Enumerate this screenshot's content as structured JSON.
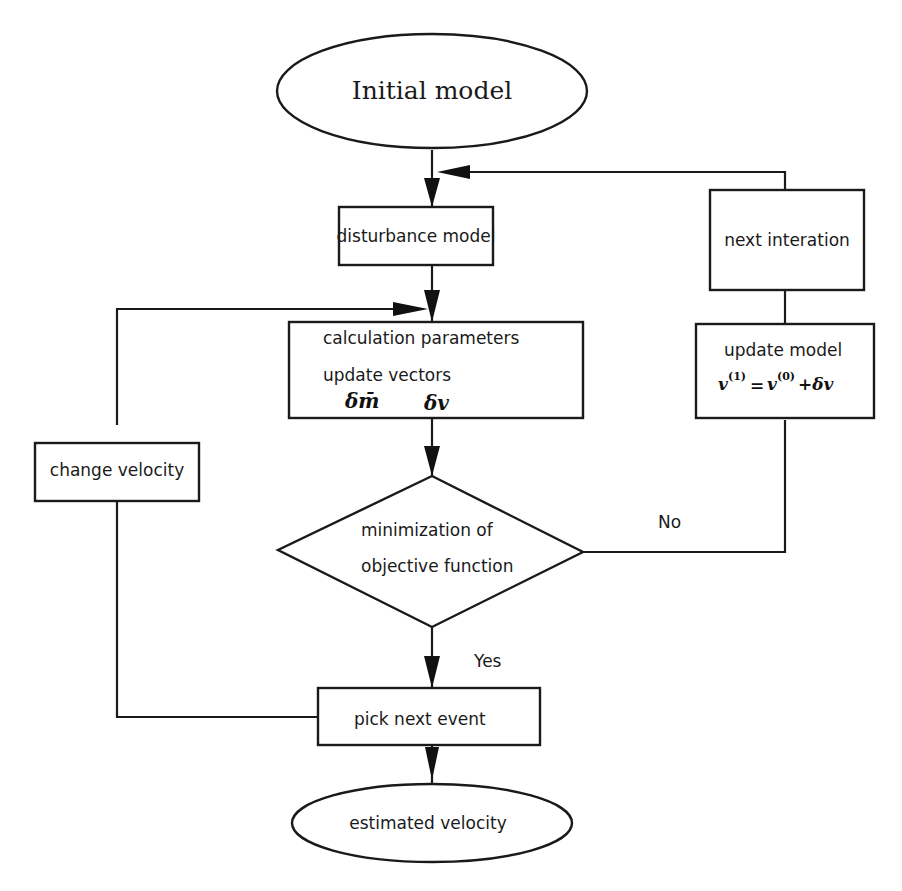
{
  "diagram": {
    "nodes": {
      "initial_model": {
        "label": "Initial model",
        "shape": "ellipse"
      },
      "disturbance_model": {
        "label": "disturbance model",
        "shape": "rect"
      },
      "calculation": {
        "line1": "calculation parameters",
        "line2": "update vectors",
        "symbol1": "δm̄",
        "symbol2": "δv",
        "shape": "rect"
      },
      "decision": {
        "line1": "minimization of",
        "line2": "objective function",
        "shape": "diamond"
      },
      "pick_next_event": {
        "label": "pick next event",
        "shape": "rect"
      },
      "estimated_velocity": {
        "label": "estimated velocity",
        "shape": "ellipse"
      },
      "change_velocity": {
        "label": "change velocity",
        "shape": "rect"
      },
      "next_iteration": {
        "label": "next interation",
        "shape": "rect"
      },
      "update_model": {
        "line1": "update model",
        "formula_lhs": "v",
        "formula_lhs_sup": "(1)",
        "formula_eq": "=",
        "formula_rhs": "v",
        "formula_rhs_sup": "(0)",
        "formula_plus": "+δv",
        "shape": "rect"
      }
    },
    "edge_labels": {
      "no": "No",
      "yes": "Yes"
    },
    "colors": {
      "stroke": "#1a1a1a",
      "background": "#ffffff"
    }
  }
}
